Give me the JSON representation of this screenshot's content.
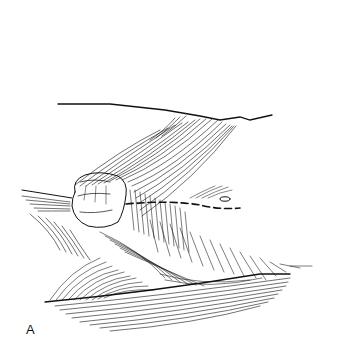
{
  "figure": {
    "panel_label": "A",
    "colors": {
      "ink": "#111111",
      "background": "#ffffff"
    }
  }
}
